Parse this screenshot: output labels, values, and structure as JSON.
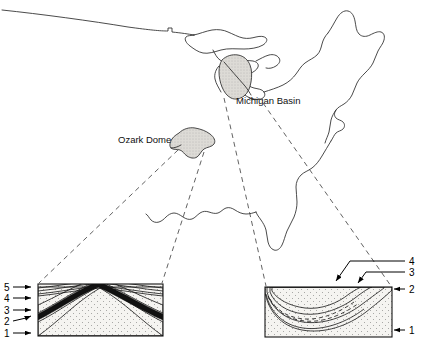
{
  "figure": {
    "map_labels": [
      {
        "id": "ozark-dome",
        "text": "Ozark Dome",
        "x": 118,
        "y": 143
      },
      {
        "id": "michigan-basin",
        "text": "Michigan Basin",
        "x": 236,
        "y": 104
      }
    ],
    "colors": {
      "ink": "#141414",
      "coastline": "#2b2b2b",
      "region_fill": "#d8d8d8",
      "dash": "#3a3a3a",
      "unit1_fill": "#f2f1ee",
      "unit2_fill": "#e6e4df",
      "unit3_fill": "#111111",
      "unit4_fill": "#ebe9e4",
      "unit5_fill": "#dedcd6",
      "background": "#ffffff"
    }
  },
  "cross_sections": {
    "left": {
      "name": "ozark-dome-section",
      "structure": "dome",
      "box": {
        "x": 38,
        "y": 284,
        "width": 125,
        "height": 52
      },
      "labels": [
        {
          "value": "5",
          "text_x": 6,
          "text_y": 290,
          "arrow_y": 287,
          "arrow_x2": 37
        },
        {
          "value": "4",
          "text_x": 6,
          "text_y": 301,
          "arrow_y": 298,
          "arrow_x2": 37
        },
        {
          "value": "3",
          "text_x": 6,
          "text_y": 313,
          "arrow_y": 310,
          "arrow_x2": 37
        },
        {
          "value": "2",
          "text_x": 6,
          "text_y": 324,
          "arrow_y": 316,
          "arrow_x2": 37
        },
        {
          "value": "1",
          "text_x": 6,
          "text_y": 336,
          "arrow_y": 332,
          "arrow_x2": 37
        }
      ]
    },
    "right": {
      "name": "michigan-basin-section",
      "structure": "basin",
      "box": {
        "x": 265,
        "y": 287,
        "width": 127,
        "height": 50
      },
      "labels": [
        {
          "value": "4",
          "text_x": 411,
          "text_y": 262
        },
        {
          "value": "3",
          "text_x": 411,
          "text_y": 273
        },
        {
          "value": "2",
          "text_x": 411,
          "text_y": 290
        },
        {
          "value": "1",
          "text_x": 411,
          "text_y": 331
        }
      ]
    }
  },
  "stratigraphic_units": [
    {
      "number": "1",
      "role": "basement-lowest-unit"
    },
    {
      "number": "2",
      "role": "unit-2"
    },
    {
      "number": "3",
      "role": "dark-marker-bed"
    },
    {
      "number": "4",
      "role": "unit-4"
    },
    {
      "number": "5",
      "role": "uppermost-unit"
    }
  ]
}
